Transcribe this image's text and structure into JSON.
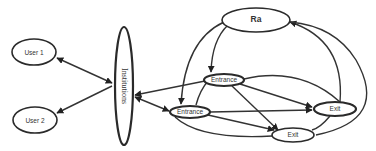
{
  "diagram": {
    "type": "directed-graph",
    "colors": {
      "stroke": "#2a2a2a",
      "fill": "#ffffff",
      "text": "#333333",
      "background": "#ffffff"
    },
    "nodes": {
      "user1": {
        "label": "User 1"
      },
      "user2": {
        "label": "User 2"
      },
      "institutions": {
        "label": "Institutions"
      },
      "ra": {
        "label": "Ra"
      },
      "entrance_top": {
        "label": "Entrance"
      },
      "entrance_bottom": {
        "label": "Entrance"
      },
      "exit_right": {
        "label": "Exit"
      },
      "exit_bottom": {
        "label": "Exit"
      }
    },
    "edges": [
      {
        "from": "institutions",
        "to": "user1",
        "bidirectional": true
      },
      {
        "from": "institutions",
        "to": "user2",
        "bidirectional": true
      },
      {
        "from": "entrance_top",
        "to": "institutions"
      },
      {
        "from": "institutions",
        "to": "entrance_bottom",
        "bidirectional": true
      },
      {
        "from": "entrance_bottom",
        "to": "entrance_top"
      },
      {
        "from": "ra",
        "to": "entrance_top"
      },
      {
        "from": "ra",
        "to": "entrance_bottom"
      },
      {
        "from": "entrance_top",
        "to": "exit_right"
      },
      {
        "from": "entrance_top",
        "to": "exit_bottom"
      },
      {
        "from": "entrance_bottom",
        "to": "exit_right"
      },
      {
        "from": "entrance_bottom",
        "to": "exit_bottom"
      },
      {
        "from": "exit_right",
        "to": "ra"
      },
      {
        "from": "exit_bottom",
        "to": "ra"
      },
      {
        "from": "entrance_top",
        "to": "exit_right",
        "curved": true
      },
      {
        "from": "entrance_bottom",
        "to": "exit_bottom",
        "curved": true
      }
    ]
  }
}
